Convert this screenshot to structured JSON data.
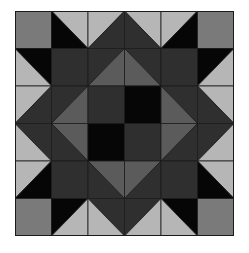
{
  "grid": {
    "rows": 6,
    "cols": 6
  },
  "palette": {
    "K": "#060606",
    "D": "#2f2f2f",
    "M": "#5b5b5b",
    "C": "#7a7a7a",
    "L": "#b6b6b6",
    "line": "#1a1a1a"
  },
  "cells": [
    [
      {
        "t": "solid",
        "c": "C"
      },
      {
        "t": "bs",
        "tr": "L",
        "bl": "K"
      },
      {
        "t": "fs",
        "tl": "L",
        "br": "D"
      },
      {
        "t": "bs",
        "tr": "L",
        "bl": "D"
      },
      {
        "t": "fs",
        "tl": "L",
        "br": "K"
      },
      {
        "t": "solid",
        "c": "C"
      }
    ],
    [
      {
        "t": "bs",
        "tr": "K",
        "bl": "L"
      },
      {
        "t": "solid",
        "c": "D"
      },
      {
        "t": "fs",
        "tl": "D",
        "br": "M"
      },
      {
        "t": "bs",
        "tr": "D",
        "bl": "M"
      },
      {
        "t": "solid",
        "c": "D"
      },
      {
        "t": "fs",
        "tl": "K",
        "br": "L"
      }
    ],
    [
      {
        "t": "fs",
        "tl": "L",
        "br": "D"
      },
      {
        "t": "fs",
        "tl": "D",
        "br": "M"
      },
      {
        "t": "solid",
        "c": "D"
      },
      {
        "t": "solid",
        "c": "K"
      },
      {
        "t": "bs",
        "tr": "D",
        "bl": "M"
      },
      {
        "t": "bs",
        "tr": "L",
        "bl": "D"
      }
    ],
    [
      {
        "t": "bs",
        "tr": "D",
        "bl": "L"
      },
      {
        "t": "bs",
        "tr": "M",
        "bl": "D"
      },
      {
        "t": "solid",
        "c": "K"
      },
      {
        "t": "solid",
        "c": "D"
      },
      {
        "t": "fs",
        "tl": "M",
        "br": "D"
      },
      {
        "t": "fs",
        "tl": "D",
        "br": "L"
      }
    ],
    [
      {
        "t": "fs",
        "tl": "L",
        "br": "K"
      },
      {
        "t": "solid",
        "c": "D"
      },
      {
        "t": "bs",
        "tr": "M",
        "bl": "D"
      },
      {
        "t": "fs",
        "tl": "M",
        "br": "D"
      },
      {
        "t": "solid",
        "c": "D"
      },
      {
        "t": "bs",
        "tr": "L",
        "bl": "K"
      }
    ],
    [
      {
        "t": "solid",
        "c": "C"
      },
      {
        "t": "fs",
        "tl": "K",
        "br": "L"
      },
      {
        "t": "bs",
        "tr": "D",
        "bl": "L"
      },
      {
        "t": "fs",
        "tl": "D",
        "br": "L"
      },
      {
        "t": "bs",
        "tr": "K",
        "bl": "L"
      },
      {
        "t": "solid",
        "c": "C"
      }
    ]
  ]
}
